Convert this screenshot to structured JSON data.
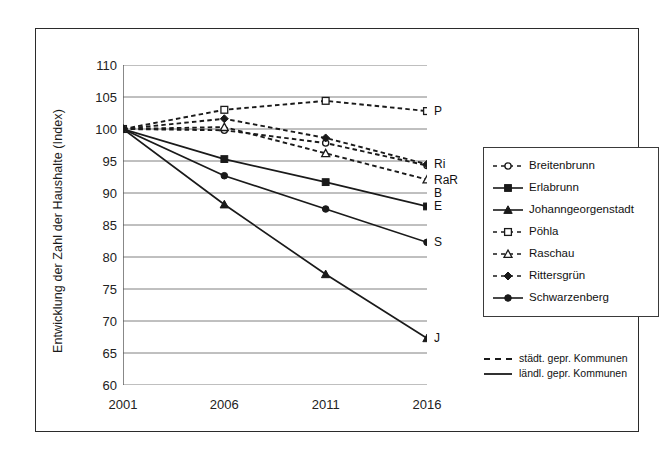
{
  "chart_data": {
    "type": "line",
    "title": "",
    "xlabel": "",
    "ylabel": "Entwicklung der Zahl der Haushalte (Index)",
    "x": [
      2001,
      2006,
      2011,
      2016
    ],
    "xticklabels": [
      "2001",
      "2006",
      "2011",
      "2016"
    ],
    "ylim": [
      60,
      110
    ],
    "yticks": [
      60,
      65,
      70,
      75,
      80,
      85,
      90,
      95,
      100,
      105,
      110
    ],
    "yticklabels": [
      "60",
      "65",
      "70",
      "75",
      "80",
      "85",
      "90",
      "95",
      "100",
      "105",
      "110"
    ],
    "grid": "horizontal",
    "legend_position": "right",
    "series": [
      {
        "name": "Breitenbrunn",
        "short": "B",
        "values": [
          100.0,
          99.8,
          97.8,
          94.3
        ],
        "style": "dashed",
        "marker": "open-circle",
        "group": "staedt"
      },
      {
        "name": "Erlabrunn",
        "short": "E",
        "values": [
          100.0,
          95.3,
          91.7,
          87.9
        ],
        "style": "solid",
        "marker": "filled-square",
        "group": "laendl"
      },
      {
        "name": "Johanngeorgenstadt",
        "short": "J",
        "values": [
          100.0,
          88.2,
          77.3,
          67.3
        ],
        "style": "solid",
        "marker": "filled-triangle",
        "group": "laendl"
      },
      {
        "name": "Pöhla",
        "short": "P",
        "values": [
          100.0,
          103.0,
          104.4,
          102.8
        ],
        "style": "dashed",
        "marker": "open-square",
        "group": "staedt"
      },
      {
        "name": "Raschau",
        "short": "RaR",
        "values": [
          100.0,
          100.3,
          96.2,
          92.1
        ],
        "style": "dashed",
        "marker": "open-triangle",
        "group": "staedt"
      },
      {
        "name": "Rittersgrün",
        "short": "Ri",
        "values": [
          100.0,
          101.6,
          98.6,
          94.5
        ],
        "style": "dashed",
        "marker": "filled-diamond",
        "group": "staedt"
      },
      {
        "name": "Schwarzenberg",
        "short": "S",
        "values": [
          100.0,
          92.7,
          87.5,
          82.3
        ],
        "style": "solid",
        "marker": "filled-circle",
        "group": "laendl"
      }
    ],
    "endpoint_labels": [
      {
        "text": "P",
        "value": 102.8
      },
      {
        "text": "Ri",
        "value": 94.5
      },
      {
        "text": "RaR",
        "value": 92.1
      },
      {
        "text": "B",
        "value": 90.0
      },
      {
        "text": "E",
        "value": 87.9
      },
      {
        "text": "S",
        "value": 82.3
      },
      {
        "text": "J",
        "value": 67.3
      }
    ]
  },
  "legend": {
    "items": [
      {
        "label": "Breitenbrunn"
      },
      {
        "label": "Erlabrunn"
      },
      {
        "label": "Johanngeorgenstadt"
      },
      {
        "label": "Pöhla"
      },
      {
        "label": "Raschau"
      },
      {
        "label": "Rittersgrün"
      },
      {
        "label": "Schwarzenberg"
      }
    ],
    "style_items": [
      {
        "label": "städt. gepr. Kommunen",
        "style": "dashed"
      },
      {
        "label": "ländl. gepr. Kommunen",
        "style": "solid"
      }
    ]
  },
  "colors": {
    "line": "#1a1a1a",
    "grid": "#808080",
    "axis": "#555555",
    "border": "#2b2b2b",
    "background": "#ffffff"
  }
}
